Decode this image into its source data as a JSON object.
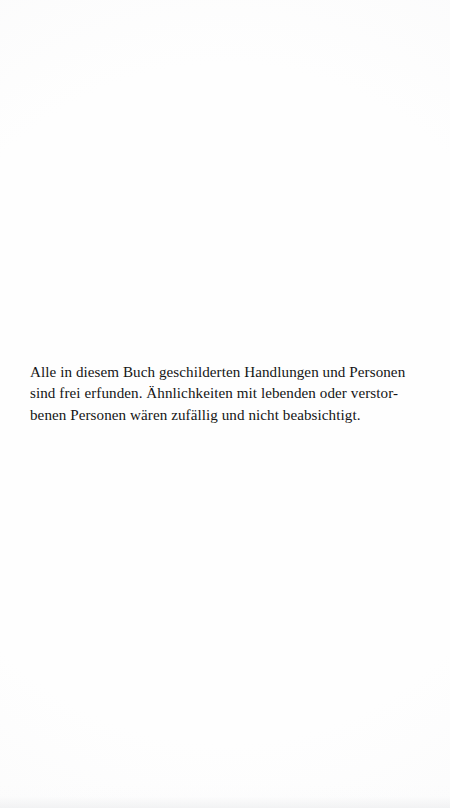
{
  "page": {
    "kind": "scanned-book-page",
    "background_color": "#fefefe",
    "text_color": "#151515"
  },
  "disclaimer": {
    "lines": [
      "Alle in diesem Buch geschilderten Handlungen und Personen",
      "sind frei erfunden. Ähnlichkeiten mit lebenden oder verstor-",
      "benen Personen wären zufällig und nicht beabsichtigt."
    ]
  }
}
